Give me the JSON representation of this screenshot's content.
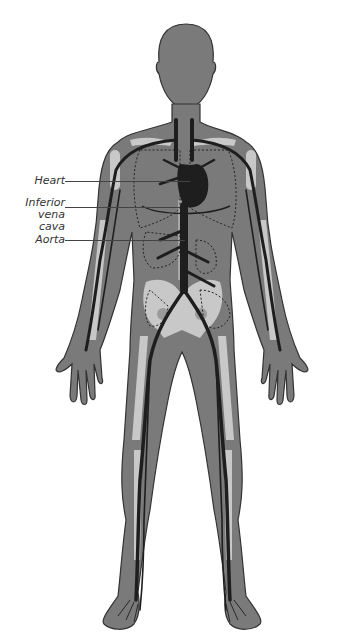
{
  "diagram": {
    "labels": [
      {
        "id": "heart",
        "text_lines": [
          "Heart"
        ]
      },
      {
        "id": "ivc",
        "text_lines": [
          "Inferior",
          "vena cava"
        ]
      },
      {
        "id": "aorta",
        "text_lines": [
          "Aorta"
        ]
      }
    ],
    "colors": {
      "body": "#7a7a7a",
      "outline": "#333333",
      "bone": "#c8c8c8",
      "vessel": "#1e1e1e",
      "background": "#ffffff"
    }
  }
}
